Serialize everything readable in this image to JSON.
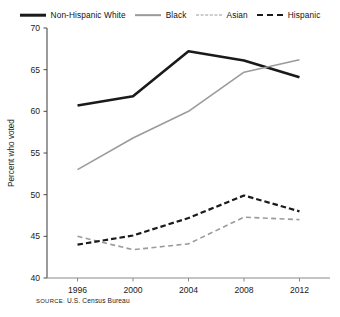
{
  "legend": {
    "position": "top",
    "entries": [
      {
        "label": "Non-Hispanic White",
        "style": "solid-thick",
        "color": "#1a1a1a",
        "icon": "line-swatch-icon"
      },
      {
        "label": "Black",
        "style": "solid-thin",
        "color": "#9b9b9b",
        "icon": "line-swatch-icon"
      },
      {
        "label": "Asian",
        "style": "dashed-thin",
        "color": "#9b9b9b",
        "icon": "line-swatch-icon"
      },
      {
        "label": "Hispanic",
        "style": "dashed-thick",
        "color": "#1a1a1a",
        "icon": "line-swatch-icon"
      }
    ]
  },
  "axes": {
    "y_label": "Percent who voted",
    "y_ticks": [
      "40",
      "45",
      "50",
      "55",
      "60",
      "65",
      "70"
    ],
    "x_ticks": [
      "1996",
      "2000",
      "2004",
      "2008",
      "2012"
    ]
  },
  "source_note": {
    "keyword": "SOURCE:",
    "text": " U.S. Census Bureau"
  },
  "chart_data": {
    "type": "line",
    "title": "",
    "xlabel": "",
    "ylabel": "Percent who voted",
    "x": [
      1996,
      2000,
      2004,
      2008,
      2012
    ],
    "categories": [
      "1996",
      "2000",
      "2004",
      "2008",
      "2012"
    ],
    "ylim": [
      40,
      70
    ],
    "yticks": [
      40,
      45,
      50,
      55,
      60,
      65,
      70
    ],
    "grid": false,
    "legend_position": "top",
    "series": [
      {
        "name": "Non-Hispanic White",
        "values": [
          60.7,
          61.8,
          67.2,
          66.1,
          64.1
        ],
        "color": "#1a1a1a",
        "style": "solid",
        "width": 2.6
      },
      {
        "name": "Black",
        "values": [
          53.0,
          56.8,
          60.0,
          64.7,
          66.2
        ],
        "color": "#9b9b9b",
        "style": "solid",
        "width": 1.6
      },
      {
        "name": "Asian",
        "values": [
          45.0,
          43.4,
          44.1,
          47.3,
          47.0
        ],
        "color": "#9b9b9b",
        "style": "dashed",
        "width": 1.6
      },
      {
        "name": "Hispanic",
        "values": [
          44.0,
          45.1,
          47.2,
          49.9,
          48.0
        ],
        "color": "#1a1a1a",
        "style": "dashed",
        "width": 2.2
      }
    ]
  }
}
